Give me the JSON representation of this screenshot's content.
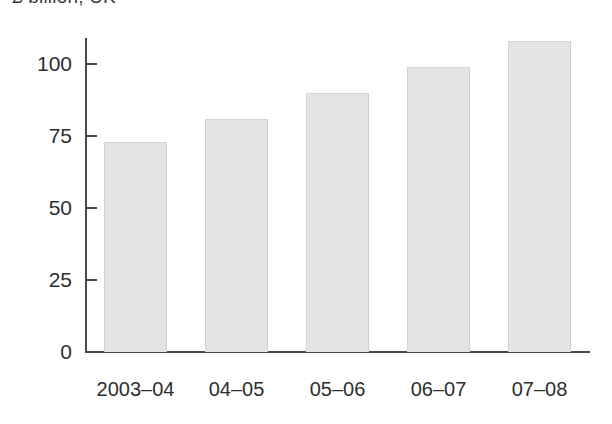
{
  "chart_data": {
    "type": "bar",
    "title": "£ billion, UK",
    "xlabel": "",
    "ylabel": "",
    "categories": [
      "2003–04",
      "04–05",
      "05–06",
      "06–07",
      "07–08"
    ],
    "values": [
      73,
      81,
      90,
      99,
      108
    ],
    "ylim": [
      0,
      112
    ],
    "yticks": [
      0,
      25,
      50,
      75,
      100
    ],
    "ytick_labels": [
      "0",
      "25",
      "50",
      "75",
      "100"
    ],
    "grid": false,
    "legend": false,
    "bar_color": "#e4e4e4",
    "axis_color": "#4a4a4a",
    "text_color": "#2e2e2e"
  }
}
